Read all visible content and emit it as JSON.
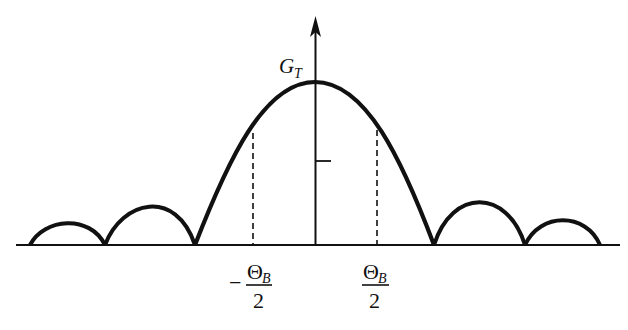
{
  "figure": {
    "type": "antenna-radiation-pattern",
    "axis_label": {
      "main": "G",
      "sub": "T"
    },
    "left_marker": {
      "sign": "−",
      "numerator": "Θ",
      "numerator_sub": "B",
      "denominator": "2"
    },
    "right_marker": {
      "numerator": "Θ",
      "numerator_sub": "B",
      "denominator": "2"
    },
    "colors": {
      "stroke": "#111111",
      "background": "#ffffff"
    },
    "lobes": [
      {
        "name": "left-outer-sidelobe",
        "start_x": 30,
        "end_x": 105,
        "peak_y": 227
      },
      {
        "name": "left-first-sidelobe",
        "start_x": 105,
        "end_x": 195,
        "peak_y": 202
      },
      {
        "name": "main-lobe",
        "start_x": 195,
        "end_x": 434,
        "peak_y": 82
      },
      {
        "name": "right-first-sidelobe",
        "start_x": 434,
        "end_x": 525,
        "peak_y": 200
      },
      {
        "name": "right-outer-sidelobe",
        "start_x": 525,
        "end_x": 600,
        "peak_y": 224
      }
    ],
    "baseline_y": 245
  }
}
